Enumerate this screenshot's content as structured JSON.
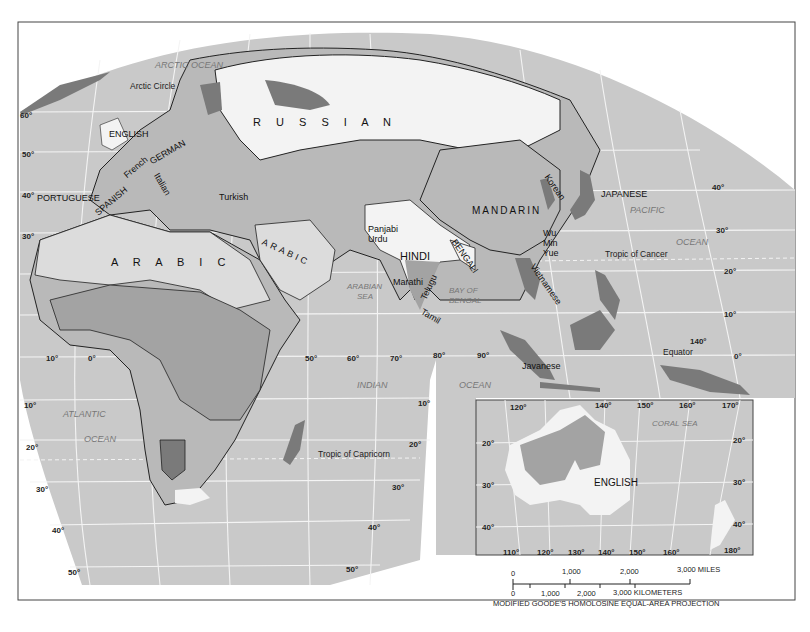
{
  "map": {
    "title": "World language distribution: Eastern Hemisphere",
    "projection": "MODIFIED GOODE'S HOMOLOSINE EQUAL-AREA PROJECTION",
    "colors": {
      "ocean": "#c9c9c9",
      "graticule": "#f2f2f2",
      "land_light": "#f3f3f3",
      "land_medium": "#b9b9b9",
      "land_mid": "#a3a3a3",
      "land_dark": "#7a7a7a",
      "border": "#222222"
    },
    "major_languages": {
      "russian": "R U S S I A N",
      "arabic_africa": "A R A B I C",
      "arabic_arabia": "ARABIC",
      "hindi": "HINDI",
      "mandarin": "MANDARIN",
      "english_uk": "ENGLISH",
      "english_aus": "ENGLISH",
      "japanese": "JAPANESE",
      "portuguese": "PORTUGUESE",
      "spanish": "SPANISH",
      "german": "GERMAN",
      "bengali": "BENGALI"
    },
    "minor_languages": {
      "french": "French",
      "italian": "Italian",
      "turkish": "Turkish",
      "panjabi": "Panjabi",
      "urdu": "Urdu",
      "marathi": "Marathi",
      "telugu": "Telugu",
      "tamil": "Tamil",
      "korean": "Korean",
      "wu": "Wu",
      "min": "Min",
      "yue": "Yue",
      "vietnamese": "Vietnamese",
      "javanese": "Javanese"
    },
    "oceans": {
      "arctic": "ARCTIC OCEAN",
      "atlantic_1": "ATLANTIC",
      "atlantic_2": "OCEAN",
      "indian_1": "INDIAN",
      "indian_2": "OCEAN",
      "pacific_1": "PACIFIC",
      "pacific_2": "OCEAN",
      "arabian_1": "ARABIAN",
      "arabian_2": "SEA",
      "bengal_1": "BAY OF",
      "bengal_2": "BENGAL",
      "coral": "CORAL SEA"
    },
    "features": {
      "arctic_circle": "Arctic Circle",
      "tropic_cancer": "Tropic of Cancer",
      "tropic_capricorn": "Tropic of Capricorn",
      "equator": "Equator"
    },
    "latitudes_left": [
      "60°",
      "50°",
      "40°",
      "30°",
      "10°",
      "20°",
      "30°",
      "40°",
      "50°"
    ],
    "latitudes_right": [
      "40°",
      "30°",
      "20°",
      "10°",
      "0°"
    ],
    "latitudes_indian": [
      "10°",
      "20°",
      "30°",
      "40°",
      "50°"
    ],
    "longitudes_main": [
      "10°",
      "0°",
      "50°",
      "60°",
      "70°",
      "80°",
      "90°",
      "140°"
    ],
    "inset": {
      "top_longitudes": [
        "120°",
        "140°",
        "150°",
        "160°",
        "170°"
      ],
      "bottom_longitudes": [
        "110°",
        "120°",
        "130°",
        "140°",
        "150°",
        "160°",
        "180°"
      ],
      "left_latitudes": [
        "20°",
        "30°",
        "40°"
      ],
      "right_latitudes": [
        "20°",
        "30°",
        "40°"
      ]
    },
    "scale_bar": {
      "miles": [
        "0",
        "1,000",
        "2,000",
        "3,000 MILES"
      ],
      "kilometers": [
        "0",
        "1,000",
        "2,000",
        "3,000 KILOMETERS"
      ]
    }
  }
}
